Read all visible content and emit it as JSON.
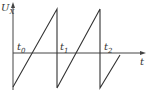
{
  "diagram": {
    "type": "sawtooth-waveform",
    "y_axis_label": "U",
    "y_axis_label_sub": "X",
    "x_axis_label": "t",
    "time_markers": [
      {
        "label": "t",
        "sub": "0"
      },
      {
        "label": "t",
        "sub": "1"
      },
      {
        "label": "t",
        "sub": "2"
      }
    ],
    "colors": {
      "line": "#333333",
      "background": "#ffffff"
    }
  }
}
